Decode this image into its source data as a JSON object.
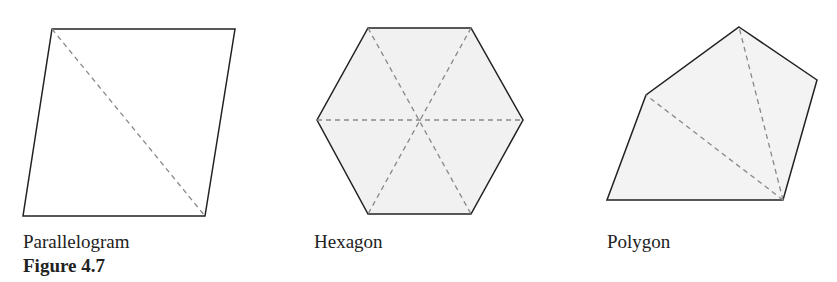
{
  "figure": {
    "caption": "Figure 4.7",
    "shapes": [
      {
        "name": "Parallelogram",
        "label": "Parallelogram",
        "fill": "#ffffff",
        "vertices": [
          [
            52,
            29
          ],
          [
            235,
            29
          ],
          [
            205,
            216
          ],
          [
            23,
            216
          ]
        ],
        "diagonals": [
          [
            [
              52,
              29
            ],
            [
              205,
              216
            ]
          ]
        ]
      },
      {
        "name": "Hexagon",
        "label": "Hexagon",
        "fill": "#f1f1f1",
        "vertices": [
          [
            368,
            28
          ],
          [
            471,
            28
          ],
          [
            523,
            120
          ],
          [
            471,
            214
          ],
          [
            368,
            214
          ],
          [
            317,
            120
          ]
        ],
        "diagonals": [
          [
            [
              368,
              28
            ],
            [
              471,
              214
            ]
          ],
          [
            [
              471,
              28
            ],
            [
              368,
              214
            ]
          ],
          [
            [
              317,
              120
            ],
            [
              523,
              120
            ]
          ]
        ]
      },
      {
        "name": "Polygon",
        "label": "Polygon",
        "fill": "#f3f3f3",
        "vertices": [
          [
            739,
            27
          ],
          [
            817,
            80
          ],
          [
            783,
            200
          ],
          [
            607,
            200
          ],
          [
            646,
            95
          ]
        ],
        "diagonals": [
          [
            [
              783,
              200
            ],
            [
              646,
              95
            ]
          ],
          [
            [
              783,
              200
            ],
            [
              739,
              27
            ]
          ]
        ]
      }
    ]
  },
  "colors": {
    "stroke": "#222222",
    "dash": "#888888"
  }
}
